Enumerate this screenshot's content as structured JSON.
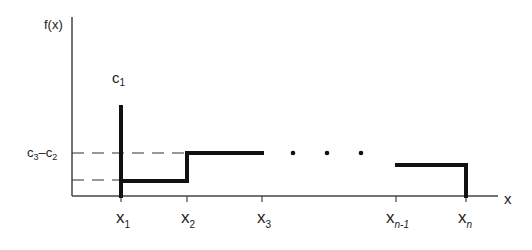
{
  "diagram": {
    "y_axis_label": "f(x)",
    "x_axis_label": "x",
    "spike_label": {
      "base": "c",
      "sub": "1"
    },
    "level_label": {
      "a": "c",
      "a_sub": "3",
      "dash": "–",
      "b": "c",
      "b_sub": "2"
    },
    "x_ticks": [
      {
        "base": "x",
        "sub": "1"
      },
      {
        "base": "x",
        "sub": "2"
      },
      {
        "base": "x",
        "sub": "3"
      },
      {
        "base": "x",
        "sub": "n-1"
      },
      {
        "base": "x",
        "sub": "n"
      }
    ],
    "ellipsis": "• • •",
    "colors": {
      "line": "#111111",
      "axis": "#444444",
      "text": "#222222"
    }
  }
}
